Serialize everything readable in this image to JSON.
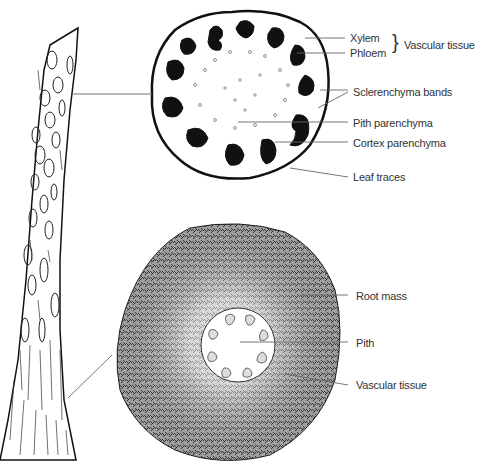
{
  "diagram": {
    "top_section": {
      "labels": {
        "xylem": "Xylem",
        "phloem": "Phloem",
        "vascular_group": "Vascular tissue",
        "sclerenchyma": "Sclerenchyma bands",
        "pith_parenchyma": "Pith parenchyma",
        "cortex_parenchyma": "Cortex parenchyma",
        "leaf_traces": "Leaf traces"
      }
    },
    "bottom_section": {
      "labels": {
        "root_mass": "Root mass",
        "pith": "Pith",
        "vascular_tissue": "Vascular tissue"
      }
    },
    "colors": {
      "ink": "#111111",
      "leader": "#666666",
      "text": "#333333",
      "background": "#ffffff"
    }
  }
}
